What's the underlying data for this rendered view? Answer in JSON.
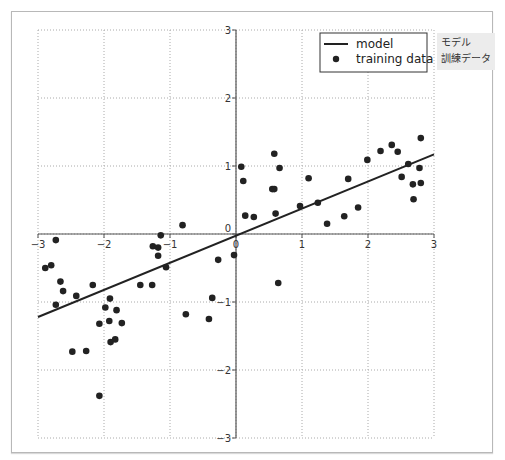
{
  "annotations": {
    "model_jp": "モデル",
    "training_data_jp": "訓練データ"
  },
  "chart_data": {
    "type": "scatter",
    "title": "",
    "xlabel": "",
    "ylabel": "",
    "xlim": [
      -3,
      3
    ],
    "ylim": [
      -3,
      3
    ],
    "xticks": [
      -3,
      -2,
      -1,
      0,
      1,
      2,
      3
    ],
    "yticks": [
      -3,
      -2,
      -1,
      0,
      1,
      2,
      3
    ],
    "xtick_labels": [
      "−3",
      "−2",
      "−1",
      "0",
      "1",
      "2",
      "3"
    ],
    "ytick_labels": [
      "−3",
      "−2",
      "−1",
      "0",
      "1",
      "2",
      "3"
    ],
    "grid": true,
    "spines": "centered at origin",
    "legend": {
      "position": "upper right",
      "entries": [
        "model",
        "training data"
      ]
    },
    "series": [
      {
        "name": "model",
        "type": "line",
        "color": "#222222",
        "x": [
          -3,
          3
        ],
        "y": [
          -1.22,
          1.17
        ]
      },
      {
        "name": "training data",
        "type": "scatter",
        "color": "#222222",
        "points": [
          [
            -2.73,
            -0.09
          ],
          [
            -2.89,
            -0.5
          ],
          [
            -2.8,
            -0.46
          ],
          [
            -2.66,
            -0.7
          ],
          [
            -2.62,
            -0.84
          ],
          [
            -2.42,
            -0.91
          ],
          [
            -2.73,
            -1.04
          ],
          [
            -2.17,
            -0.75
          ],
          [
            -1.91,
            -0.95
          ],
          [
            -1.98,
            -1.08
          ],
          [
            -1.81,
            -1.12
          ],
          [
            -2.07,
            -1.32
          ],
          [
            -1.92,
            -1.28
          ],
          [
            -1.73,
            -1.31
          ],
          [
            -1.9,
            -1.59
          ],
          [
            -1.83,
            -1.55
          ],
          [
            -2.48,
            -1.73
          ],
          [
            -2.27,
            -1.72
          ],
          [
            -2.07,
            -2.38
          ],
          [
            -1.45,
            -0.75
          ],
          [
            -0.81,
            0.13
          ],
          [
            -1.14,
            -0.02
          ],
          [
            -1.26,
            -0.18
          ],
          [
            -1.18,
            -0.2
          ],
          [
            -1.18,
            -0.32
          ],
          [
            -1.06,
            -0.49
          ],
          [
            -1.27,
            -0.75
          ],
          [
            -0.27,
            -0.38
          ],
          [
            -0.03,
            -0.31
          ],
          [
            -0.36,
            -0.94
          ],
          [
            -0.76,
            -1.18
          ],
          [
            -0.41,
            -1.25
          ],
          [
            0.58,
            1.18
          ],
          [
            0.08,
            0.99
          ],
          [
            0.66,
            0.97
          ],
          [
            0.11,
            0.78
          ],
          [
            1.1,
            0.82
          ],
          [
            0.55,
            0.66
          ],
          [
            0.58,
            0.66
          ],
          [
            1.7,
            0.81
          ],
          [
            0.14,
            0.27
          ],
          [
            0.27,
            0.25
          ],
          [
            0.6,
            0.3
          ],
          [
            0.97,
            0.41
          ],
          [
            1.24,
            0.46
          ],
          [
            1.38,
            0.15
          ],
          [
            1.64,
            0.26
          ],
          [
            0.64,
            -0.72
          ],
          [
            2.8,
            1.41
          ],
          [
            2.36,
            1.31
          ],
          [
            2.19,
            1.22
          ],
          [
            2.45,
            1.21
          ],
          [
            1.99,
            1.09
          ],
          [
            2.61,
            1.03
          ],
          [
            2.78,
            0.97
          ],
          [
            2.51,
            0.84
          ],
          [
            2.68,
            0.73
          ],
          [
            2.8,
            0.75
          ],
          [
            2.69,
            0.51
          ],
          [
            1.85,
            0.39
          ]
        ]
      }
    ]
  }
}
